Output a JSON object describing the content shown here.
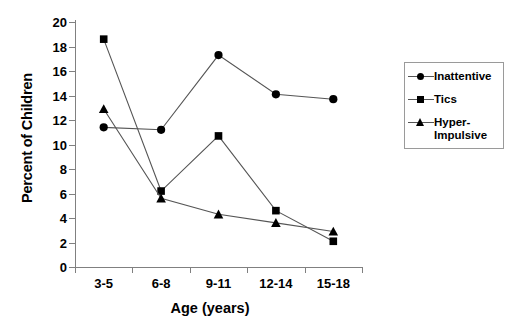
{
  "chart_data": {
    "type": "line",
    "title": "",
    "xlabel": "Age (years)",
    "ylabel": "Percent of Children",
    "categories": [
      "3-5",
      "6-8",
      "9-11",
      "12-14",
      "15-18"
    ],
    "ylim": [
      0,
      20
    ],
    "ytick_step": 2,
    "yticks": [
      0,
      2,
      4,
      6,
      8,
      10,
      12,
      14,
      16,
      18,
      20
    ],
    "grid": false,
    "legend_position": "right",
    "series": [
      {
        "name": "Inattentive",
        "marker": "circle",
        "values": [
          11.4,
          11.2,
          17.3,
          14.1,
          13.7
        ]
      },
      {
        "name": "Tics",
        "marker": "square",
        "values": [
          18.6,
          6.2,
          10.7,
          4.6,
          2.1
        ]
      },
      {
        "name": "Hyper-\nImpulsive",
        "marker": "triangle",
        "values": [
          12.9,
          5.6,
          4.3,
          3.6,
          2.9
        ]
      }
    ]
  },
  "legend": {
    "items": [
      {
        "label": "Inattentive",
        "marker": "circle-marker"
      },
      {
        "label": "Tics",
        "marker": "square-marker"
      },
      {
        "label": "Hyper-\nImpulsive",
        "marker": "triangle-marker"
      }
    ]
  },
  "colors": {
    "series": "#000000",
    "axis": "#808080",
    "line": "#555555",
    "background": "#ffffff"
  }
}
